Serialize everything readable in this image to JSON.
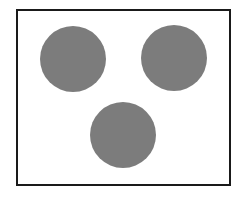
{
  "figure": {
    "frame": {
      "border_color": "#1a1a1a",
      "background": "#ffffff"
    },
    "circles": [
      {
        "id": "top-left",
        "cx": 73,
        "cy": 59,
        "r": 33,
        "fill": "#808080"
      },
      {
        "id": "top-right",
        "cx": 174,
        "cy": 58,
        "r": 33,
        "fill": "#808080"
      },
      {
        "id": "bottom",
        "cx": 123,
        "cy": 135,
        "r": 33,
        "fill": "#808080"
      }
    ],
    "count": 3
  }
}
